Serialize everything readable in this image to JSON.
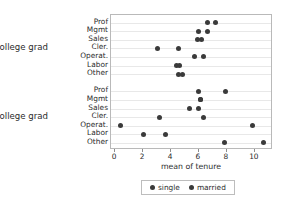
{
  "chart_data": {
    "type": "scatter",
    "title": "",
    "xlabel": "mean of tenure",
    "ylabel": "",
    "xlim": [
      -0.3,
      11.3
    ],
    "xticks": [
      0,
      2,
      4,
      6,
      8,
      10
    ],
    "xtick_labels": [
      "0",
      "2",
      "4",
      "6",
      "8",
      "10"
    ],
    "grid": true,
    "legend_position": "bottom",
    "legend": [
      {
        "name": "single",
        "color": "#3a3a3a",
        "marker": "circle"
      },
      {
        "name": "married",
        "color": "#3a3a3a",
        "marker": "circle"
      }
    ],
    "groups": [
      {
        "label": "not college grad",
        "categories": [
          "Prof",
          "Mgmt",
          "Sales",
          "Cler.",
          "Operat.",
          "Labor",
          "Other"
        ],
        "series": [
          {
            "name": "single",
            "values": [
              6.6,
              6.0,
              5.9,
              3.0,
              5.7,
              4.4,
              4.5
            ]
          },
          {
            "name": "married",
            "values": [
              7.2,
              6.6,
              6.2,
              4.5,
              6.3,
              4.6,
              4.8
            ]
          }
        ]
      },
      {
        "label": "college grad",
        "categories": [
          "Prof",
          "Mgmt",
          "Sales",
          "Cler.",
          "Operat.",
          "Labor",
          "Other"
        ],
        "series": [
          {
            "name": "single",
            "values": [
              6.0,
              6.1,
              5.3,
              3.2,
              0.4,
              2.0,
              7.8
            ]
          },
          {
            "name": "married",
            "values": [
              7.9,
              6.1,
              6.0,
              6.3,
              9.8,
              3.6,
              10.6
            ]
          }
        ]
      }
    ]
  }
}
